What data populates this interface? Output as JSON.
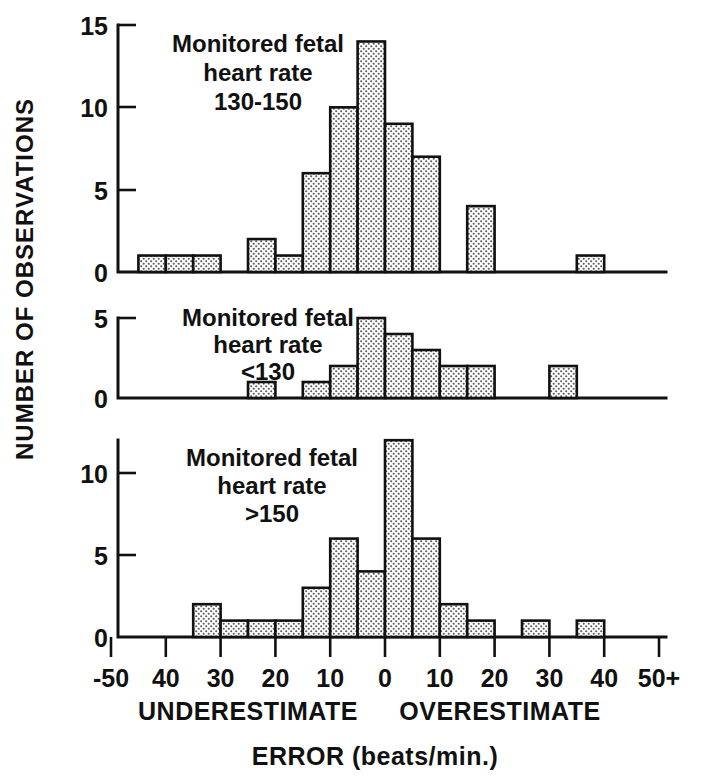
{
  "chart_data": {
    "type": "bar",
    "title": "",
    "xlabel": "ERROR (beats/min.)",
    "ylabel": "NUMBER OF OBSERVATIONS",
    "xlim": [
      -50,
      50
    ],
    "bin_width": 5,
    "grid": false,
    "legend_position": "none",
    "x_tick_labels": [
      "-50",
      "40",
      "30",
      "20",
      "10",
      "0",
      "10",
      "20",
      "30",
      "40",
      "50+"
    ],
    "x_tick_values": [
      -50,
      -40,
      -30,
      -20,
      -10,
      0,
      10,
      20,
      30,
      40,
      50
    ],
    "direction_labels": {
      "left": "UNDERESTIMATE",
      "right": "OVERESTIMATE"
    },
    "panels": [
      {
        "id": "panel-130-150",
        "annotation_lines": [
          "Monitored fetal",
          "heart rate",
          "130-150"
        ],
        "ylim": [
          0,
          15
        ],
        "y_tick_labels": [
          "0",
          "5",
          "10",
          "15"
        ],
        "y_tick_values": [
          0,
          5,
          10,
          15
        ],
        "bin_starts": [
          -50,
          -45,
          -40,
          -35,
          -30,
          -25,
          -20,
          -15,
          -10,
          -5,
          0,
          5,
          10,
          15,
          20,
          25,
          30,
          35,
          40,
          45
        ],
        "values": [
          0,
          1,
          1,
          1,
          0,
          2,
          1,
          6,
          10,
          14,
          9,
          7,
          0,
          4,
          0,
          0,
          0,
          1,
          0,
          0
        ]
      },
      {
        "id": "panel-lt-130",
        "annotation_lines": [
          "Monitored fetal",
          "heart rate",
          "<130"
        ],
        "ylim": [
          0,
          5
        ],
        "y_tick_labels": [
          "0",
          "5"
        ],
        "y_tick_values": [
          0,
          5
        ],
        "bin_starts": [
          -50,
          -45,
          -40,
          -35,
          -30,
          -25,
          -20,
          -15,
          -10,
          -5,
          0,
          5,
          10,
          15,
          20,
          25,
          30,
          35,
          40,
          45
        ],
        "values": [
          0,
          0,
          0,
          0,
          0,
          1,
          0,
          1,
          2,
          5,
          4,
          3,
          2,
          2,
          0,
          0,
          2,
          0,
          0,
          0
        ]
      },
      {
        "id": "panel-gt-150",
        "annotation_lines": [
          "Monitored fetal",
          "heart rate",
          ">150"
        ],
        "ylim": [
          0,
          12.5
        ],
        "y_tick_labels": [
          "0",
          "5",
          "10"
        ],
        "y_tick_values": [
          0,
          5,
          10
        ],
        "bin_starts": [
          -50,
          -45,
          -40,
          -35,
          -30,
          -25,
          -20,
          -15,
          -10,
          -5,
          0,
          5,
          10,
          15,
          20,
          25,
          30,
          35,
          40,
          45
        ],
        "values": [
          0,
          0,
          0,
          2,
          1,
          1,
          1,
          3,
          6,
          4,
          12,
          6,
          2,
          1,
          0,
          1,
          0,
          1,
          0,
          0
        ]
      }
    ]
  },
  "colors": {
    "ink": "#111111",
    "background": "#ffffff",
    "bar_fill": "#e8e8e8",
    "bar_dot": "#4a4a4a"
  }
}
